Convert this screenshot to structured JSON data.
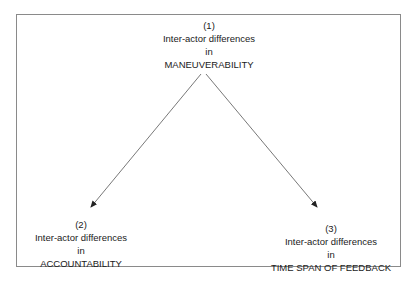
{
  "diagram": {
    "nodes": [
      {
        "number": "(1)",
        "line1": "Inter-actor differences",
        "line2": "in",
        "line3": "MANEUVERABILITY"
      },
      {
        "number": "(2)",
        "line1": "Inter-actor differences",
        "line2": "in",
        "line3": "ACCOUNTABILITY"
      },
      {
        "number": "(3)",
        "line1": "Inter-actor differences",
        "line2": "in",
        "line3": "TIME SPAN OF FEEDBACK"
      }
    ],
    "edges": [
      {
        "from": "(1)",
        "to": "(2)"
      },
      {
        "from": "(1)",
        "to": "(3)"
      }
    ],
    "colors": {
      "line": "#555555",
      "frame": "#8a8a8a",
      "text": "#1a1a1a"
    }
  }
}
